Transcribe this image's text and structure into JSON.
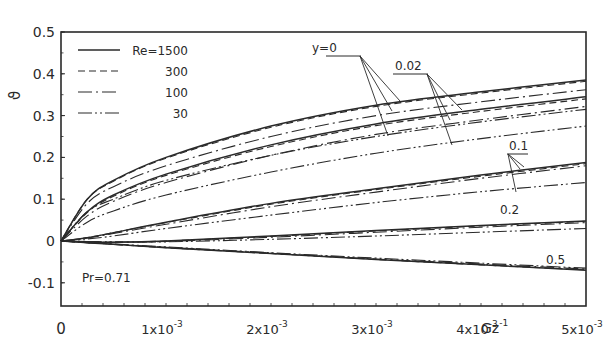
{
  "chart_data": {
    "type": "line",
    "title": "",
    "xlabel": "Gz^-1",
    "ylabel": "ϑ",
    "xlim": [
      0,
      0.005
    ],
    "ylim": [
      -0.15,
      0.5
    ],
    "grid": false,
    "x_ticks": [
      {
        "value": 0,
        "label": "0"
      },
      {
        "value": 0.001,
        "label": "1x10",
        "exp": "-3"
      },
      {
        "value": 0.002,
        "label": "2x10",
        "exp": "-3"
      },
      {
        "value": 0.003,
        "label": "3x10",
        "exp": "-3"
      },
      {
        "value": 0.004,
        "label": "4x10",
        "exp": "-3"
      },
      {
        "value": 0.005,
        "label": "5x10",
        "exp": "-3"
      }
    ],
    "y_ticks": [
      {
        "value": 0.5,
        "label": "0.5"
      },
      {
        "value": 0.4,
        "label": "0.4"
      },
      {
        "value": 0.3,
        "label": "0.3"
      },
      {
        "value": 0.2,
        "label": "0.2"
      },
      {
        "value": 0.1,
        "label": "0.1"
      },
      {
        "value": 0.0,
        "label": "0"
      },
      {
        "value": -0.1,
        "label": "-0.1"
      }
    ],
    "legend": {
      "position": "upper-left",
      "entries": [
        {
          "label": "Re=1500",
          "style": "solid"
        },
        {
          "label": "300",
          "style": "dashed"
        },
        {
          "label": "100",
          "style": "dashdot"
        },
        {
          "label": "30",
          "style": "dashdotdot"
        }
      ]
    },
    "annotations": [
      {
        "text": "Pr=0.71"
      },
      {
        "text": "y=0"
      },
      {
        "text": "0.02"
      },
      {
        "text": "0.1"
      },
      {
        "text": "0.2"
      },
      {
        "text": "0.5"
      }
    ],
    "x": [
      0,
      0.00025,
      0.0005,
      0.001,
      0.002,
      0.003,
      0.004,
      0.005
    ],
    "series": [
      {
        "name": "y=0, Re=1500",
        "style": "solid",
        "values": [
          0,
          0.1,
          0.145,
          0.2,
          0.275,
          0.325,
          0.357,
          0.385
        ]
      },
      {
        "name": "y=0, Re=300",
        "style": "dashed",
        "values": [
          0,
          0.1,
          0.143,
          0.198,
          0.272,
          0.322,
          0.354,
          0.382
        ]
      },
      {
        "name": "y=0, Re=100",
        "style": "dashdot",
        "values": [
          0,
          0.09,
          0.13,
          0.18,
          0.25,
          0.3,
          0.333,
          0.362
        ]
      },
      {
        "name": "y=0, Re=30",
        "style": "dashdotdot",
        "values": [
          0,
          0.07,
          0.1,
          0.145,
          0.205,
          0.25,
          0.285,
          0.315
        ]
      },
      {
        "name": "y=0.02, Re=1500",
        "style": "solid",
        "values": [
          0,
          0.07,
          0.11,
          0.16,
          0.23,
          0.28,
          0.315,
          0.345
        ]
      },
      {
        "name": "y=0.02, Re=300",
        "style": "dashed",
        "values": [
          0,
          0.068,
          0.107,
          0.157,
          0.226,
          0.276,
          0.31,
          0.34
        ]
      },
      {
        "name": "y=0.02, Re=100",
        "style": "dashdot",
        "values": [
          0,
          0.06,
          0.095,
          0.14,
          0.205,
          0.255,
          0.29,
          0.322
        ]
      },
      {
        "name": "y=0.02, Re=30",
        "style": "dashdotdot",
        "values": [
          0,
          0.045,
          0.072,
          0.11,
          0.165,
          0.21,
          0.245,
          0.275
        ]
      },
      {
        "name": "y=0.1, Re=1500",
        "style": "solid",
        "values": [
          0,
          0.008,
          0.02,
          0.045,
          0.09,
          0.125,
          0.158,
          0.188
        ]
      },
      {
        "name": "y=0.1, Re=300",
        "style": "dashed",
        "values": [
          0,
          0.008,
          0.02,
          0.044,
          0.088,
          0.123,
          0.155,
          0.185
        ]
      },
      {
        "name": "y=0.1, Re=100",
        "style": "dashdot",
        "values": [
          0,
          0.007,
          0.018,
          0.04,
          0.082,
          0.117,
          0.15,
          0.18
        ]
      },
      {
        "name": "y=0.1, Re=30",
        "style": "dashdotdot",
        "values": [
          0,
          0.005,
          0.012,
          0.03,
          0.062,
          0.092,
          0.118,
          0.14
        ]
      },
      {
        "name": "y=0.2, Re=1500",
        "style": "solid",
        "values": [
          0,
          -0.002,
          -0.003,
          0.0,
          0.012,
          0.025,
          0.037,
          0.048
        ]
      },
      {
        "name": "y=0.2, Re=300",
        "style": "dashed",
        "values": [
          0,
          -0.002,
          -0.003,
          0.0,
          0.011,
          0.024,
          0.036,
          0.047
        ]
      },
      {
        "name": "y=0.2, Re=100",
        "style": "dashdot",
        "values": [
          0,
          -0.002,
          -0.003,
          -0.001,
          0.009,
          0.021,
          0.033,
          0.044
        ]
      },
      {
        "name": "y=0.2, Re=30",
        "style": "dashdotdot",
        "values": [
          0,
          -0.001,
          -0.002,
          -0.002,
          0.004,
          0.012,
          0.021,
          0.03
        ]
      },
      {
        "name": "y=0.5, Re=1500",
        "style": "solid",
        "values": [
          0,
          -0.004,
          -0.008,
          -0.016,
          -0.03,
          -0.044,
          -0.057,
          -0.07
        ]
      },
      {
        "name": "y=0.5, Re=300",
        "style": "dashed",
        "values": [
          0,
          -0.004,
          -0.008,
          -0.016,
          -0.03,
          -0.044,
          -0.057,
          -0.069
        ]
      },
      {
        "name": "y=0.5, Re=100",
        "style": "dashdot",
        "values": [
          0,
          -0.004,
          -0.008,
          -0.015,
          -0.029,
          -0.043,
          -0.055,
          -0.067
        ]
      },
      {
        "name": "y=0.5, Re=30",
        "style": "dashdotdot",
        "values": [
          0,
          -0.004,
          -0.007,
          -0.014,
          -0.028,
          -0.041,
          -0.053,
          -0.065
        ]
      }
    ]
  },
  "labels": {
    "ylabel": "ϑ",
    "xlabel_base": "Gz",
    "xlabel_exp": "-1",
    "pr_note": "Pr=0.71",
    "group_y0": "y=0",
    "group_002": "0.02",
    "group_01": "0.1",
    "group_02": "0.2",
    "group_05": "0.5"
  },
  "colors": {
    "ink": "#2a2a2a",
    "background": "#ffffff"
  }
}
